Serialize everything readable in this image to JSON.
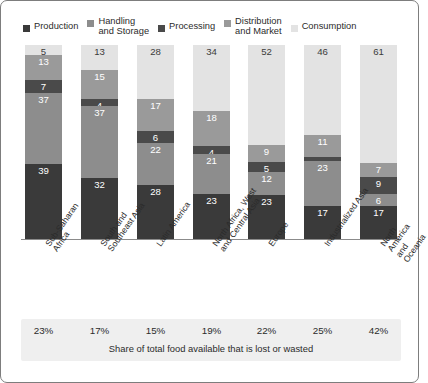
{
  "chart_data": {
    "type": "bar",
    "title": "",
    "subtitle": "",
    "xlabel": "",
    "ylabel": "",
    "ylim": [
      0,
      100
    ],
    "stacked": true,
    "normalized_percent": true,
    "grid": false,
    "legend_position": "top",
    "orientation": "vertical",
    "categories": [
      "Sub-Saharan\nAfrica",
      "South and\nSoutheast Asia",
      "Latin America",
      "North Africa, West\nand Central Asia",
      "Europe",
      "Industrialized Asia",
      "North America\nand Oceania"
    ],
    "series": [
      {
        "name": "Production",
        "color": "#3a3a3a",
        "label_color": "light",
        "values": [
          39,
          32,
          28,
          23,
          23,
          17,
          17
        ]
      },
      {
        "name": "Handling\nand Storage",
        "color": "#8d8d8d",
        "label_color": "light",
        "values": [
          37,
          37,
          22,
          21,
          12,
          23,
          6
        ]
      },
      {
        "name": "Processing",
        "color": "#4a4a4a",
        "label_color": "light",
        "values": [
          7,
          4,
          6,
          4,
          5,
          2,
          9
        ]
      },
      {
        "name": "Distribution\nand Market",
        "color": "#9a9a9a",
        "label_color": "light",
        "values": [
          13,
          15,
          17,
          18,
          9,
          11,
          7
        ]
      },
      {
        "name": "Consumption",
        "color": "#e3e3e3",
        "label_color": "dark",
        "values": [
          5,
          13,
          28,
          34,
          52,
          46,
          61
        ]
      }
    ],
    "annotations": {
      "footer_caption": "Share of total food available that is lost or wasted",
      "footer_values": [
        "23%",
        "17%",
        "15%",
        "19%",
        "22%",
        "25%",
        "42%"
      ]
    }
  }
}
